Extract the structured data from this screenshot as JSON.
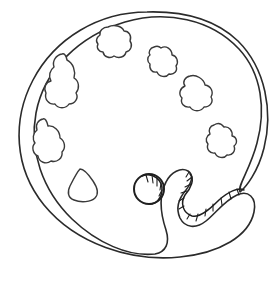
{
  "artwork": {
    "title": "Artist Paint Palette",
    "style": "black and white line drawing / coloring page",
    "subject": "oval artist's palette tilted on its side",
    "background_color": "#ffffff",
    "line_color": "#2b2b2b",
    "fill_color": "#ffffff",
    "canvas": {
      "width": 273,
      "height": 281
    }
  },
  "shapes": {
    "palette_body": {
      "name": "palette-body",
      "description": "large tilted oval outline with an S-shaped thumb notch cut into the lower right edge",
      "path": "M 147 12 C 99 12, 55 38, 33 80 C 12 120, 14 168, 44 205 C 76 244, 131 262, 180 257 C 220 253, 249 236, 254 212 C 257 197, 248 190, 237 195 C 224 201, 216 213, 206 221 C 196 229, 185 228, 180 218 C 175 207, 180 197, 186 190 C 192 182, 194 175, 188 171 C 181 167, 171 172, 166 182 C 158 197, 161 215, 166 230 C 170 243, 166 252, 155 254 C 129 257, 97 243, 72 219 C 42 190, 29 150, 36 113 C 44 70, 79 36, 125 22 C 166 10, 211 19, 239 49 C 262 74, 266 110, 257 143 C 250 170, 237 186, 240 192 C 246 187, 258 172, 264 148 C 273 112, 266 69, 238 41 C 215 19, 182 11, 147 12 Z"
    },
    "thumb_hole": {
      "name": "thumb-hole",
      "description": "circular thumb hole near center-bottom with curved shading on the upper right",
      "cx": 149,
      "cy": 189,
      "r": 15
    },
    "thumb_hole_shading": {
      "name": "thumb-hole-shading",
      "description": "crescent of short ladder hatch marks on the upper-right rim of the thumb hole"
    },
    "notch_shading": {
      "name": "notch-shading",
      "description": "double line with ladder rungs running along the S-curve of the thumb notch"
    },
    "paint_blobs": [
      {
        "name": "paint-blob-top-center",
        "index": 0,
        "position": "top center of palette",
        "path": "M 108 27 C 103 27, 99 31, 100 35 C 97 37, 95 41, 98 44 C 96 48, 99 52, 103 52 C 104 57, 110 59, 114 56 C 119 59, 125 57, 126 52 C 131 51, 133 45, 130 41 C 132 36, 129 31, 124 31 C 122 26, 114 24, 108 27 Z"
      },
      {
        "name": "paint-blob-top-right",
        "index": 1,
        "position": "upper right, below top blob",
        "path": "M 154 47 C 150 48, 148 52, 150 55 C 147 57, 147 62, 150 64 C 149 69, 152 73, 157 72 C 159 77, 166 78, 169 74 C 174 75, 178 71, 176 66 C 179 62, 177 56, 172 55 C 172 49, 166 45, 161 48 C 159 46, 156 46, 154 47 Z"
      },
      {
        "name": "paint-blob-right-upper",
        "index": 2,
        "position": "right side, upper",
        "path": "M 190 76 C 185 77, 182 82, 185 86 C 180 88, 178 94, 182 98 C 180 103, 184 108, 190 107 C 193 112, 201 112, 204 107 C 210 107, 214 102, 211 97 C 214 92, 211 86, 205 85 C 204 79, 196 74, 190 76 Z"
      },
      {
        "name": "paint-blob-right-lower",
        "index": 3,
        "position": "right side, lower",
        "path": "M 214 125 C 210 126, 208 130, 210 134 C 206 136, 205 141, 208 144 C 206 149, 210 154, 215 153 C 217 158, 224 159, 227 155 C 232 156, 236 151, 234 146 C 238 143, 237 137, 232 136 C 233 131, 229 126, 224 127 C 221 123, 217 123, 214 125 Z"
      },
      {
        "name": "paint-blob-left-upper",
        "index": 4,
        "position": "left side, upper - large peanut shape",
        "path": "M 62 54 C 56 55, 52 61, 54 67 C 50 70, 48 76, 51 81 C 46 82, 43 88, 46 93 C 44 99, 49 105, 55 104 C 58 109, 66 109, 69 104 C 75 104, 79 98, 76 93 C 80 88, 79 81, 74 78 C 76 71, 73 63, 67 60 C 66 55, 64 53, 62 54 Z"
      },
      {
        "name": "paint-blob-left-lower",
        "index": 5,
        "position": "left side, lower",
        "path": "M 43 119 C 38 120, 35 125, 37 130 C 33 133, 32 139, 35 143 C 31 147, 33 154, 38 156 C 39 162, 46 165, 51 161 C 57 163, 63 158, 62 152 C 66 148, 65 141, 60 138 C 60 131, 54 125, 48 126 C 47 121, 45 118, 43 119 Z"
      },
      {
        "name": "paint-blob-bottom-left",
        "index": 6,
        "position": "lower left, rounded triangular drop",
        "path": "M 80 169 C 77 172, 73 180, 70 186 C 67 192, 68 198, 74 200 C 81 203, 91 202, 95 198 C 99 194, 97 187, 93 181 C 89 175, 84 169, 80 169 Z"
      }
    ]
  },
  "labels": {
    "blob_count": "7",
    "thumb_hole_label": "thumb hole",
    "notch_label": "thumb rest notch"
  }
}
